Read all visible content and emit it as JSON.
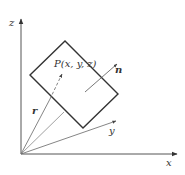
{
  "diagram": {
    "axes": {
      "x_label": "x",
      "y_label": "y",
      "z_label": "z"
    },
    "point_label": "P(x, y, z)",
    "position_vector_label": "r",
    "normal_vector_label": "n",
    "colors": {
      "line": "#333333",
      "thin_line": "#666666",
      "background": "#ffffff"
    }
  }
}
